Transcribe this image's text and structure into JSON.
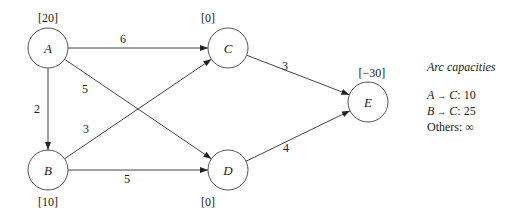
{
  "diagram": {
    "nodes": [
      {
        "id": "A",
        "label": "A",
        "supply": "[20]",
        "cx": 48,
        "cy": 48,
        "supply_x": 48,
        "supply_y": 22
      },
      {
        "id": "B",
        "label": "B",
        "supply": "[10]",
        "cx": 48,
        "cy": 170,
        "supply_x": 48,
        "supply_y": 206
      },
      {
        "id": "C",
        "label": "C",
        "supply": "[0]",
        "cx": 228,
        "cy": 48,
        "supply_x": 208,
        "supply_y": 22
      },
      {
        "id": "D",
        "label": "D",
        "supply": "[0]",
        "cx": 228,
        "cy": 170,
        "supply_x": 208,
        "supply_y": 206
      },
      {
        "id": "E",
        "label": "E",
        "supply": "[−30]",
        "cx": 368,
        "cy": 102,
        "supply_x": 372,
        "supply_y": 77
      }
    ],
    "arcs": [
      {
        "from": "A",
        "to": "C",
        "cost": "6",
        "lx": 123,
        "ly": 43
      },
      {
        "from": "A",
        "to": "D",
        "cost": "5",
        "lx": 85,
        "ly": 93
      },
      {
        "from": "A",
        "to": "B",
        "cost": "2",
        "lx": 37,
        "ly": 113
      },
      {
        "from": "B",
        "to": "C",
        "cost": "3",
        "lx": 86,
        "ly": 133
      },
      {
        "from": "B",
        "to": "D",
        "cost": "5",
        "lx": 127,
        "ly": 183
      },
      {
        "from": "C",
        "to": "E",
        "cost": "3",
        "lx": 285,
        "ly": 70
      },
      {
        "from": "D",
        "to": "E",
        "cost": "4",
        "lx": 286,
        "ly": 152
      }
    ]
  },
  "legend": {
    "title": "Arc capacities",
    "lines": [
      {
        "from": "A",
        "arrow": "→",
        "to": "C",
        "value": ": 10"
      },
      {
        "from": "B",
        "arrow": "→",
        "to": "C",
        "value": ": 25"
      },
      {
        "text": "Others: ∞"
      }
    ]
  }
}
